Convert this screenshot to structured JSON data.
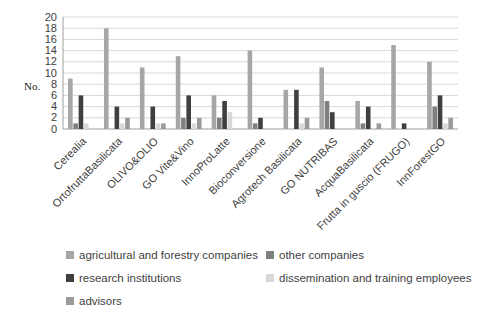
{
  "chart_data": {
    "type": "bar",
    "title": "",
    "ylabel": "No.",
    "xlabel": "",
    "ylim": [
      0,
      20
    ],
    "ytick_step": 2,
    "grid": true,
    "legend_position": "bottom",
    "categories": [
      "Cerealia",
      "OrtofruttaBasilicata",
      "OLIVO&OLIO",
      "GO Vite&Vino",
      "InnoProLatte",
      "Bioconversione",
      "Agrotech Basilicata",
      "GO NUTRIBAS",
      "AcquaBasilicata",
      "Frutta in guscio (FRUGO)",
      "InnForestGO"
    ],
    "series": [
      {
        "name": "agricultural and forestry companies",
        "color": "#a6a6a6",
        "values": [
          9,
          18,
          11,
          13,
          6,
          14,
          7,
          11,
          5,
          15,
          12
        ]
      },
      {
        "name": "other companies",
        "color": "#7f7f7f",
        "values": [
          1,
          0,
          0,
          2,
          2,
          1,
          0,
          5,
          1,
          0,
          4
        ]
      },
      {
        "name": "research institutions",
        "color": "#3f3f3f",
        "values": [
          6,
          4,
          4,
          6,
          5,
          2,
          7,
          3,
          4,
          1,
          6
        ]
      },
      {
        "name": "dissemination and training employees",
        "color": "#d9d9d9",
        "values": [
          1,
          1,
          1,
          1,
          3,
          0,
          1,
          0,
          0,
          0,
          1
        ]
      },
      {
        "name": "advisors",
        "color": "#9a9a9a",
        "values": [
          0,
          2,
          1,
          2,
          0,
          0,
          2,
          0,
          1,
          0,
          2
        ]
      }
    ],
    "axis_color": "#9e9e9e",
    "grid_color": "#d9d9d9",
    "tick_text_color": "#404040"
  }
}
